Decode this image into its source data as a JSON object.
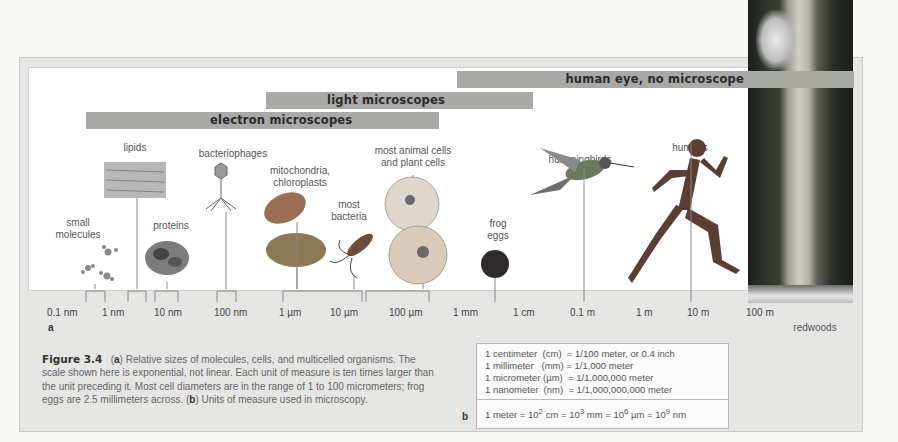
{
  "figure": {
    "number": "Figure 3.4",
    "panel_a_label": "a",
    "panel_b_label": "b",
    "caption": {
      "part_a_marker": "a",
      "part_a_text": "Relative sizes of molecules, cells, and multicelled organisms. The scale shown here is exponential, not linear. Each unit of measure is ten times larger than the unit preceding it. Most cell diameters are in the range of 1 to 100 micrometers; frog eggs are 2.5 millimeters across.",
      "part_b_marker": "b",
      "part_b_text": "Units of measure used in microscopy."
    }
  },
  "ranges": [
    {
      "label": "human eye, no microscope"
    },
    {
      "label": "light microscopes"
    },
    {
      "label": "electron microscopes"
    }
  ],
  "objects": {
    "small_molecules": "small\nmolecules",
    "lipids": "lipids",
    "proteins": "proteins",
    "bacteriophages": "bacteriophages",
    "mitochondria": "mitochondria,\nchloroplasts",
    "bacteria": "most\nbacteria",
    "cells": "most animal cells\nand plant cells",
    "frog_eggs": "frog\neggs",
    "hummingbirds": "hummingbirds",
    "humans": "humans",
    "redwoods": "redwoods"
  },
  "axis": {
    "ticks": [
      "0.1 nm",
      "1 nm",
      "10 nm",
      "100 nm",
      "1 µm",
      "10 µm",
      "100 µm",
      "1 mm",
      "1 cm",
      "0.1 m",
      "1 m",
      "10 m",
      "100 m"
    ]
  },
  "units_table": {
    "rows": [
      "1 centimeter  (cm)  = 1/100 meter, or 0.4 inch",
      "1 millimeter   (mm) = 1/1,000 meter",
      "1 micrometer (µm)  = 1/1,000,000 meter",
      "1 nanometer  (nm)  = 1/1,000,000,000 meter"
    ],
    "equivalence": {
      "prefix": "1 meter = 10",
      "e1": "2",
      "t1": " cm = 10",
      "e2": "3",
      "t2": " mm = 10",
      "e3": "6",
      "t3": " µm = 10",
      "e4": "9",
      "t4": " nm"
    }
  },
  "colors": {
    "bar": "#a9a9a8",
    "panel": "#e5e5e4",
    "plot": "#ffffff"
  }
}
